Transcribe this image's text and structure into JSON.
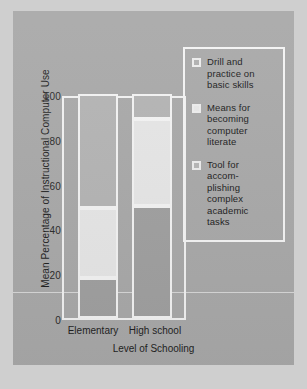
{
  "figure": {
    "background_color": "#a9a9a9",
    "frame_color": "#f2f2f2"
  },
  "chart_data": {
    "type": "bar",
    "subtype": "stacked-vertical-100",
    "title": "",
    "xlabel": "Level of Schooling",
    "ylabel": "Mean Percentage of Instructional Computer Use",
    "categories": [
      "Elementary",
      "High school"
    ],
    "ylim": [
      0,
      100
    ],
    "yticks": [
      0,
      20,
      40,
      60,
      80,
      100
    ],
    "ytick_labels": [
      "0",
      "20",
      "40",
      "60",
      "80",
      "100"
    ],
    "grid": false,
    "legend_position": "upper-right-inside",
    "series": [
      {
        "name": "Drill and practice on basic skills",
        "color": "#a0a0a0",
        "values": [
          18,
          50
        ]
      },
      {
        "name": "Means for becoming computer literate",
        "color": "#e6e6e6",
        "values": [
          31,
          39
        ]
      },
      {
        "name": "Tool for accomplishing complex academic tasks",
        "color": "#b4b4b4",
        "values": [
          51,
          11
        ]
      }
    ],
    "segment_boundaries": {
      "Elementary": [
        0,
        18,
        49,
        100
      ],
      "High school": [
        0,
        50,
        89,
        100
      ]
    }
  },
  "legend": {
    "items": [
      {
        "label": "Drill and\npractice on\nbasic skills",
        "swatch_color": "#b0b0b0"
      },
      {
        "label": "Means for\nbecoming\ncomputer\nliterate",
        "swatch_color": "#e8e8e8"
      },
      {
        "label": "Tool for\naccom-\nplishing\ncomplex\nacademic\ntasks",
        "swatch_color": "#b6b6b6"
      }
    ]
  }
}
